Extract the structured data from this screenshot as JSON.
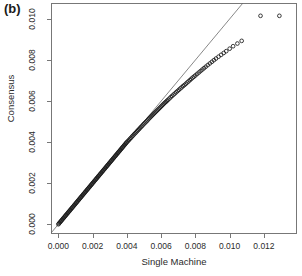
{
  "figure": {
    "panel_label": "(b)",
    "background_color": "#ffffff"
  },
  "chart_data": {
    "type": "scatter",
    "title": "",
    "subtitle": "",
    "xlabel": "Single Machine",
    "ylabel": "Consensus",
    "xlim": [
      -0.0004,
      0.0139
    ],
    "ylim": [
      -0.00045,
      0.01075
    ],
    "grid": false,
    "legend": null,
    "xticks": [
      0.0,
      0.002,
      0.004,
      0.006,
      0.008,
      0.01,
      0.012
    ],
    "xtick_labels": [
      "0.000",
      "0.002",
      "0.004",
      "0.006",
      "0.008",
      "0.010",
      "0.012"
    ],
    "yticks": [
      0.0,
      0.002,
      0.004,
      0.006,
      0.008,
      0.01
    ],
    "ytick_labels": [
      "0.000",
      "0.002",
      "0.004",
      "0.006",
      "0.008",
      "0.010"
    ],
    "marker": "open-circle",
    "marker_color": "#1a1a1a",
    "reference_line": {
      "type": "identity",
      "slope": 1.0,
      "intercept": 0.0,
      "color": "#555555",
      "width": 0.7
    },
    "annotations": [
      {
        "text": "(b)",
        "x": 0.0,
        "y": 0.0,
        "position": "figure-top-left"
      }
    ],
    "series": [
      {
        "name": "Q-Q points",
        "x": [
          0.0,
          4e-05,
          8e-05,
          0.00012,
          0.00016,
          0.0002,
          0.00024,
          0.00028,
          0.00032,
          0.00036,
          0.0004,
          0.00044,
          0.00048,
          0.00052,
          0.00056,
          0.0006,
          0.00064,
          0.00068,
          0.00072,
          0.00076,
          0.0008,
          0.00084,
          0.00088,
          0.00092,
          0.00096,
          0.001,
          0.00104,
          0.00108,
          0.00112,
          0.00116,
          0.0012,
          0.00124,
          0.00128,
          0.00132,
          0.00136,
          0.0014,
          0.00144,
          0.00148,
          0.00152,
          0.00156,
          0.0016,
          0.00164,
          0.00168,
          0.00172,
          0.00176,
          0.0018,
          0.00184,
          0.00188,
          0.00192,
          0.00196,
          0.002,
          0.00204,
          0.00208,
          0.00212,
          0.00216,
          0.0022,
          0.00224,
          0.00228,
          0.00232,
          0.00236,
          0.0024,
          0.00244,
          0.00248,
          0.00252,
          0.00256,
          0.0026,
          0.00264,
          0.00268,
          0.00272,
          0.00276,
          0.0028,
          0.00284,
          0.00288,
          0.00292,
          0.00296,
          0.003,
          0.00304,
          0.00308,
          0.00312,
          0.00316,
          0.0032,
          0.00324,
          0.00328,
          0.00332,
          0.00336,
          0.0034,
          0.00344,
          0.00348,
          0.00352,
          0.00356,
          0.0036,
          0.00364,
          0.00368,
          0.00372,
          0.00376,
          0.0038,
          0.00384,
          0.00388,
          0.00392,
          0.00396,
          0.004,
          0.00406,
          0.00412,
          0.00418,
          0.00424,
          0.0043,
          0.00436,
          0.00442,
          0.00448,
          0.00454,
          0.0046,
          0.00466,
          0.00472,
          0.00478,
          0.00484,
          0.0049,
          0.00496,
          0.00502,
          0.00508,
          0.00514,
          0.0052,
          0.00526,
          0.00532,
          0.00538,
          0.00544,
          0.0055,
          0.00556,
          0.00562,
          0.00568,
          0.00574,
          0.0058,
          0.00586,
          0.00592,
          0.00598,
          0.00604,
          0.0061,
          0.00616,
          0.00622,
          0.00628,
          0.00634,
          0.0064,
          0.00648,
          0.00656,
          0.00664,
          0.00672,
          0.0068,
          0.00688,
          0.00696,
          0.00704,
          0.00712,
          0.0072,
          0.00728,
          0.00736,
          0.00744,
          0.00752,
          0.0076,
          0.00768,
          0.00776,
          0.00784,
          0.00792,
          0.008,
          0.0081,
          0.0082,
          0.0083,
          0.0084,
          0.0085,
          0.0086,
          0.00872,
          0.00884,
          0.00896,
          0.00908,
          0.0092,
          0.00935,
          0.0095,
          0.00965,
          0.0098,
          0.01,
          0.0102,
          0.01045,
          0.0107,
          0.0118,
          0.0129
        ],
        "y": [
          0.0,
          4e-05,
          8e-05,
          0.00012,
          0.00016,
          0.0002,
          0.00024,
          0.00028,
          0.00032,
          0.00036,
          0.0004,
          0.00044,
          0.00048,
          0.00052,
          0.00056,
          0.0006,
          0.00064,
          0.00068,
          0.00072,
          0.00076,
          0.0008,
          0.00084,
          0.00088,
          0.00092,
          0.00096,
          0.001,
          0.00104,
          0.00108,
          0.00112,
          0.00116,
          0.0012,
          0.00124,
          0.00128,
          0.00132,
          0.00136,
          0.0014,
          0.00144,
          0.00148,
          0.00152,
          0.00156,
          0.0016,
          0.00164,
          0.00168,
          0.00172,
          0.00176,
          0.0018,
          0.00184,
          0.00188,
          0.00192,
          0.00196,
          0.002,
          0.00204,
          0.00208,
          0.00212,
          0.00216,
          0.0022,
          0.00224,
          0.00228,
          0.00232,
          0.00236,
          0.0024,
          0.00244,
          0.00248,
          0.00252,
          0.00256,
          0.0026,
          0.00264,
          0.00268,
          0.00272,
          0.00276,
          0.0028,
          0.00284,
          0.00288,
          0.00292,
          0.00296,
          0.003,
          0.00304,
          0.00308,
          0.00312,
          0.00316,
          0.0032,
          0.00324,
          0.00328,
          0.00332,
          0.00336,
          0.0034,
          0.00344,
          0.00348,
          0.00352,
          0.00356,
          0.0036,
          0.00364,
          0.00368,
          0.00372,
          0.00376,
          0.0038,
          0.00384,
          0.00388,
          0.00392,
          0.00396,
          0.004,
          0.00405,
          0.0041,
          0.00416,
          0.00421,
          0.00427,
          0.00432,
          0.00438,
          0.00443,
          0.00448,
          0.00454,
          0.00459,
          0.00464,
          0.0047,
          0.00475,
          0.0048,
          0.00486,
          0.00491,
          0.00496,
          0.00501,
          0.00506,
          0.00512,
          0.00517,
          0.00522,
          0.00527,
          0.00532,
          0.00537,
          0.00542,
          0.00547,
          0.00552,
          0.00557,
          0.00562,
          0.00567,
          0.00572,
          0.00577,
          0.00582,
          0.00587,
          0.00592,
          0.00596,
          0.00601,
          0.00606,
          0.00612,
          0.00619,
          0.00625,
          0.00631,
          0.00637,
          0.00643,
          0.00649,
          0.00655,
          0.00661,
          0.00667,
          0.00673,
          0.00678,
          0.00684,
          0.0069,
          0.00696,
          0.00702,
          0.00708,
          0.00714,
          0.00719,
          0.00725,
          0.00732,
          0.00739,
          0.00746,
          0.00753,
          0.0076,
          0.00767,
          0.00775,
          0.00783,
          0.00791,
          0.00799,
          0.00807,
          0.00816,
          0.00825,
          0.00834,
          0.00843,
          0.00855,
          0.00867,
          0.0088,
          0.00893,
          0.01015,
          0.01015
        ]
      }
    ]
  },
  "axes": {
    "x_axis_name": "x-axis",
    "y_axis_name": "y-axis",
    "frame_color": "#666666"
  }
}
